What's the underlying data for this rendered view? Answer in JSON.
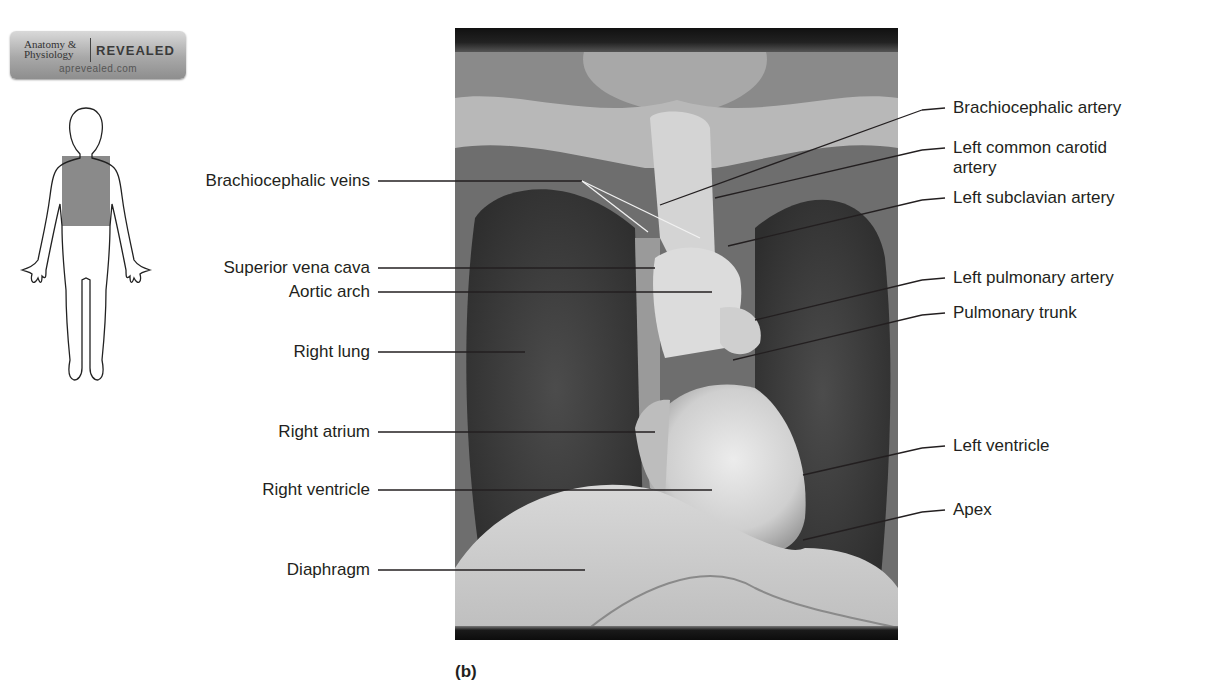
{
  "logo": {
    "line1": "Anatomy &",
    "line2": "Physiology",
    "brand": "REVEALED",
    "url": "aprevealed.com"
  },
  "figure": {
    "icon": "body-outline-icon",
    "highlighted_region": "thorax",
    "highlight_color": "#8a8a8a"
  },
  "photo": {
    "subject": "Anterior view of dissected thoracic cavity showing heart and great vessels",
    "x": 455,
    "y": 28,
    "width": 443,
    "height": 612
  },
  "caption": "(b)",
  "labels_left": [
    {
      "text": "Brachiocephalic veins",
      "tx": 370,
      "ty": 181,
      "line": [
        [
          378,
          181
        ],
        [
          582,
          181
        ],
        [
          648,
          232
        ]
      ],
      "line2": [
        [
          582,
          181
        ],
        [
          700,
          238
        ]
      ]
    },
    {
      "text": "Superior vena cava",
      "tx": 370,
      "ty": 268,
      "line": [
        [
          378,
          268
        ],
        [
          655,
          268
        ]
      ]
    },
    {
      "text": "Aortic arch",
      "tx": 370,
      "ty": 292,
      "line": [
        [
          378,
          292
        ],
        [
          712,
          292
        ]
      ]
    },
    {
      "text": "Right lung",
      "tx": 370,
      "ty": 352,
      "line": [
        [
          378,
          352
        ],
        [
          525,
          352
        ]
      ]
    },
    {
      "text": "Right atrium",
      "tx": 370,
      "ty": 432,
      "line": [
        [
          378,
          432
        ],
        [
          655,
          432
        ]
      ]
    },
    {
      "text": "Right ventricle",
      "tx": 370,
      "ty": 490,
      "line": [
        [
          378,
          490
        ],
        [
          712,
          490
        ]
      ]
    },
    {
      "text": "Diaphragm",
      "tx": 370,
      "ty": 570,
      "line": [
        [
          378,
          570
        ],
        [
          585,
          570
        ]
      ]
    }
  ],
  "labels_right": [
    {
      "text": "Brachiocephalic artery",
      "tx": 953,
      "ty": 108,
      "line": [
        [
          945,
          108
        ],
        [
          922,
          110
        ],
        [
          660,
          205
        ]
      ]
    },
    {
      "text": "Left common carotid",
      "text2": "artery",
      "tx": 953,
      "ty": 148,
      "line": [
        [
          945,
          148
        ],
        [
          922,
          150
        ],
        [
          715,
          198
        ]
      ]
    },
    {
      "text": "Left subclavian artery",
      "tx": 953,
      "ty": 198,
      "line": [
        [
          945,
          198
        ],
        [
          922,
          200
        ],
        [
          728,
          246
        ]
      ]
    },
    {
      "text": "Left pulmonary artery",
      "tx": 953,
      "ty": 278,
      "line": [
        [
          945,
          278
        ],
        [
          922,
          280
        ],
        [
          755,
          320
        ]
      ]
    },
    {
      "text": "Pulmonary trunk",
      "tx": 953,
      "ty": 313,
      "line": [
        [
          945,
          313
        ],
        [
          922,
          315
        ],
        [
          733,
          360
        ]
      ]
    },
    {
      "text": "Left ventricle",
      "tx": 953,
      "ty": 446,
      "line": [
        [
          945,
          446
        ],
        [
          922,
          448
        ],
        [
          803,
          475
        ]
      ]
    },
    {
      "text": "Apex",
      "tx": 953,
      "ty": 510,
      "line": [
        [
          945,
          510
        ],
        [
          922,
          512
        ],
        [
          803,
          540
        ]
      ]
    }
  ]
}
